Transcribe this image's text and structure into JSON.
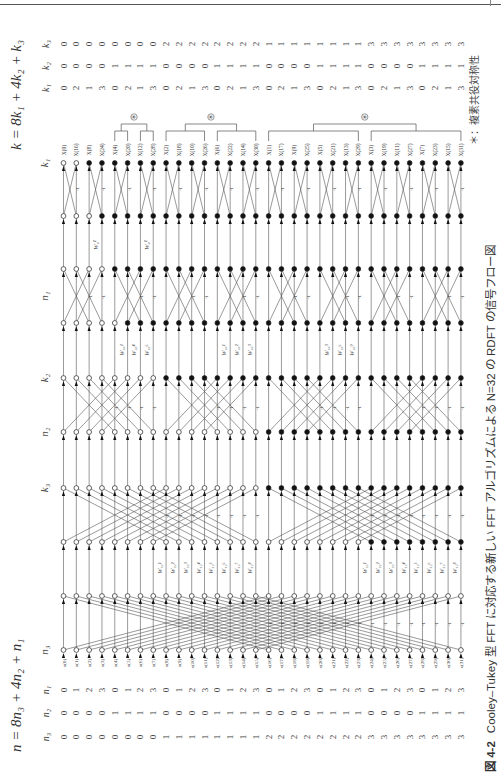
{
  "page": {
    "orientation": "rotated-90-ccw",
    "caption": {
      "figure_number": "図 4-2",
      "text": "Cooley–Tukey 型 FFT に対応する新しい FFT アルゴリズムによる N=32 の RDFT の信号フロー図"
    },
    "note": "＊：複素共役対称性"
  },
  "output_formula": {
    "text": "k = 8k₁ + 4k₂ + k₃",
    "row_labels": [
      "k₁",
      "k₂",
      "k₃"
    ],
    "k1": [
      0,
      2,
      1,
      3,
      0,
      2,
      1,
      3,
      0,
      2,
      1,
      3,
      0,
      2,
      1,
      3,
      0,
      2,
      1,
      3,
      0,
      2,
      1,
      3,
      0,
      2,
      1,
      3,
      0,
      2,
      1,
      3
    ],
    "k2": [
      0,
      0,
      0,
      0,
      1,
      1,
      1,
      1,
      0,
      0,
      0,
      0,
      1,
      1,
      1,
      1,
      0,
      0,
      0,
      0,
      1,
      1,
      1,
      1,
      0,
      0,
      0,
      0,
      1,
      1,
      1,
      1
    ],
    "k3": [
      0,
      0,
      0,
      0,
      0,
      0,
      0,
      0,
      2,
      2,
      2,
      2,
      2,
      2,
      2,
      2,
      1,
      1,
      1,
      1,
      1,
      1,
      1,
      1,
      3,
      3,
      3,
      3,
      3,
      3,
      3,
      3
    ]
  },
  "input_formula": {
    "text": "n = 8n₃ + 4n₂ + n₁",
    "row_labels": [
      "n₁",
      "n₂",
      "n₃"
    ],
    "n1": [
      0,
      1,
      2,
      3,
      0,
      1,
      2,
      3,
      0,
      1,
      2,
      3,
      0,
      1,
      2,
      3,
      0,
      1,
      2,
      3,
      0,
      1,
      2,
      3,
      0,
      1,
      2,
      3,
      0,
      1,
      2,
      3
    ],
    "n2": [
      0,
      0,
      0,
      0,
      1,
      1,
      1,
      1,
      0,
      0,
      0,
      0,
      1,
      1,
      1,
      1,
      0,
      0,
      0,
      0,
      1,
      1,
      1,
      1,
      0,
      0,
      0,
      0,
      1,
      1,
      1,
      1
    ],
    "n3": [
      0,
      0,
      0,
      0,
      0,
      0,
      0,
      0,
      1,
      1,
      1,
      1,
      1,
      1,
      1,
      1,
      2,
      2,
      2,
      2,
      2,
      2,
      2,
      2,
      3,
      3,
      3,
      3,
      3,
      3,
      3,
      3
    ]
  },
  "outputs": [
    "X(0)",
    "X(16)",
    "X(8)",
    "X(24)",
    "X(4)",
    "X(20)",
    "X(12)",
    "X(28)",
    "X(2)",
    "X(18)",
    "X(10)",
    "X(26)",
    "X(6)",
    "X(22)",
    "X(14)",
    "X(30)",
    "X(1)",
    "X(17)",
    "X(9)",
    "X(25)",
    "X(5)",
    "X(21)",
    "X(13)",
    "X(29)",
    "X(3)",
    "X(19)",
    "X(11)",
    "X(27)",
    "X(7)",
    "X(23)",
    "X(15)",
    "X(31)"
  ],
  "inputs": [
    "x(0)",
    "x(1)",
    "x(2)",
    "x(3)",
    "x(4)",
    "x(5)",
    "x(6)",
    "x(7)",
    "x(8)",
    "x(9)",
    "x(10)",
    "x(11)",
    "x(12)",
    "x(13)",
    "x(14)",
    "x(15)",
    "x(16)",
    "x(17)",
    "x(18)",
    "x(19)",
    "x(20)",
    "x(21)",
    "x(22)",
    "x(23)",
    "x(24)",
    "x(25)",
    "x(26)",
    "x(27)",
    "x(28)",
    "x(29)",
    "x(30)",
    "x(31)"
  ],
  "stage_labels": [
    {
      "label": "k₁",
      "y": 163
    },
    {
      "label": "n₁",
      "y": 296
    },
    {
      "label": "k₂",
      "y": 378
    },
    {
      "label": "n₂",
      "y": 432
    },
    {
      "label": "k₃",
      "y": 488
    },
    {
      "label": "n₃",
      "y": 650
    }
  ],
  "symmetry_brackets": [
    {
      "mark": "＊",
      "groups": [
        [
          5,
          6
        ],
        [
          7,
          8
        ]
      ]
    },
    {
      "mark": "＊",
      "groups": [
        [
          9,
          12
        ],
        [
          13,
          16
        ]
      ]
    },
    {
      "mark": "＊",
      "groups": [
        [
          17,
          24
        ],
        [
          25,
          32
        ]
      ]
    }
  ],
  "butterfly_minus_label": "-1",
  "twiddle_labels": {
    "stage_k1": [
      "W₄¹",
      "W₄¹"
    ],
    "stage_k2": [
      "W₁₆²",
      "W₁₆⁴",
      "W₁₆⁶",
      "W₁₆¹",
      "W₁₆²",
      "W₁₆³",
      "W₁₆³",
      "W₁₆⁶",
      "W₁₆⁹"
    ],
    "stage_k3": [
      "W₃₂¹",
      "W₃₂²",
      "W₃₂³",
      "W₃₂⁴",
      "W₃₂⁵",
      "W₃₂⁶",
      "W₃₂⁷",
      "W₃₂⁸"
    ]
  },
  "colors": {
    "line": "#555555",
    "node_open": "#ffffff",
    "node_filled": "#111111",
    "text": "#333333"
  }
}
